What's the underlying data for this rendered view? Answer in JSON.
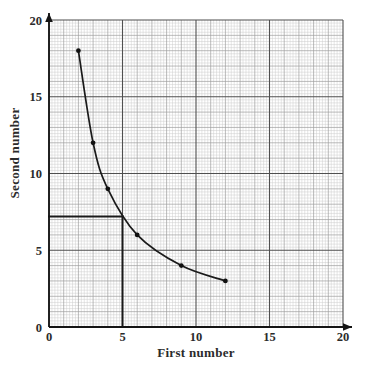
{
  "chart_data": {
    "type": "line",
    "title": "",
    "subtitle": "",
    "xlabel": "First number",
    "ylabel": "Second number",
    "xlim": [
      0,
      20
    ],
    "ylim": [
      0,
      20
    ],
    "xticks": [
      0,
      5,
      10,
      15,
      20
    ],
    "yticks": [
      0,
      5,
      10,
      15,
      20
    ],
    "xtick_labels": [
      "0",
      "5",
      "10",
      "15",
      "20"
    ],
    "ytick_labels": [
      "0",
      "5",
      "10",
      "15",
      "20"
    ],
    "grid": true,
    "grid_minor_step": 0.2,
    "grid_medium_step": 1,
    "grid_major_step": 5,
    "legend": null,
    "legend_position": "none",
    "series": [
      {
        "name": "First number vs Second number",
        "relation": "xy = 36",
        "marker": "filled-circle",
        "line_style": "solid-smooth-curve",
        "x": [
          2,
          3,
          4,
          6,
          9,
          12
        ],
        "y": [
          18,
          12,
          9,
          6,
          4,
          3
        ],
        "points": [
          {
            "x": 2,
            "y": 18
          },
          {
            "x": 3,
            "y": 12
          },
          {
            "x": 4,
            "y": 9
          },
          {
            "x": 6,
            "y": 6
          },
          {
            "x": 9,
            "y": 4
          },
          {
            "x": 12,
            "y": 3
          }
        ]
      }
    ],
    "annotations": [
      {
        "name": "construction-line-vertical",
        "type": "vertical-segment",
        "x": 5,
        "y_from": 0,
        "y_to": 7.2
      },
      {
        "name": "construction-line-horizontal",
        "type": "horizontal-segment",
        "y": 7.2,
        "x_from": 0,
        "x_to": 5
      }
    ],
    "read_off": {
      "x": 5,
      "y": 7.2
    },
    "colors": {
      "curve": "#1a1a1a",
      "marker": "#111111",
      "axis": "#1a1a1a",
      "grid_minor": "#c9c9c9",
      "grid_medium": "#9a9a9a",
      "grid_major": "#4a4a4a",
      "construction": "#1a1a1a",
      "text": "#2b2b2b",
      "background": "#ffffff"
    }
  },
  "axes": {
    "x": {
      "title": "First number",
      "ticks": [
        {
          "value": 0,
          "label": "0"
        },
        {
          "value": 5,
          "label": "5"
        },
        {
          "value": 10,
          "label": "10"
        },
        {
          "value": 15,
          "label": "15"
        },
        {
          "value": 20,
          "label": "20"
        }
      ]
    },
    "y": {
      "title": "Second number",
      "ticks": [
        {
          "value": 0,
          "label": "0"
        },
        {
          "value": 5,
          "label": "5"
        },
        {
          "value": 10,
          "label": "10"
        },
        {
          "value": 15,
          "label": "15"
        },
        {
          "value": 20,
          "label": "20"
        }
      ]
    }
  }
}
